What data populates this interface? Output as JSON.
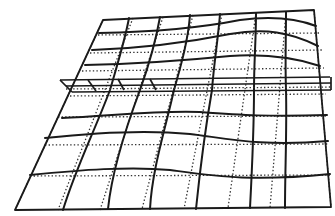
{
  "figure": {
    "colors": {
      "line": "#1a1a1a",
      "dotted": "#333333",
      "background": "#ffffff"
    },
    "frame": {
      "top_left": [
        103,
        20
      ],
      "top_right": [
        314,
        10
      ],
      "bottom_right": [
        331,
        207
      ],
      "bottom_left": [
        15,
        210
      ]
    },
    "band": {
      "y_top_left": 80,
      "y_bottom_left": 92,
      "x_start": 60,
      "x_end": 331
    },
    "legend": []
  }
}
